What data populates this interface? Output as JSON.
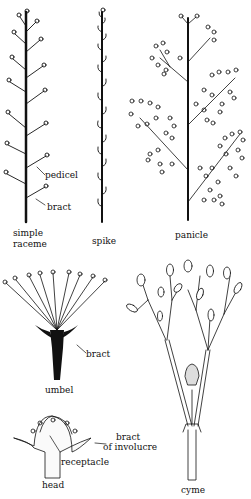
{
  "diagram": {
    "colors": {
      "ink": "#111111",
      "background": "#ffffff"
    },
    "panels": [
      {
        "id": "simple-raceme",
        "caption_line1": "simple",
        "caption_line2": "raceme",
        "annotations": [
          "pedicel",
          "bract"
        ]
      },
      {
        "id": "spike",
        "caption": "spike"
      },
      {
        "id": "panicle",
        "caption": "panicle"
      },
      {
        "id": "umbel",
        "caption": "umbel",
        "annotations": [
          "bract"
        ]
      },
      {
        "id": "head",
        "caption": "head",
        "annotations": [
          "bract",
          "of involucre",
          "receptacle"
        ]
      },
      {
        "id": "cyme",
        "caption": "cyme"
      }
    ]
  }
}
